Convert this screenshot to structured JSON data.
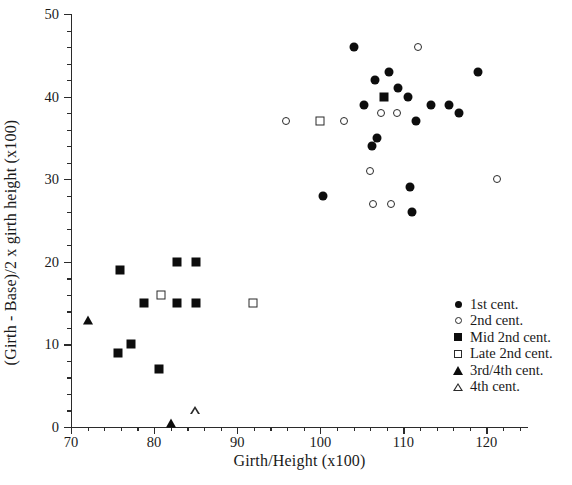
{
  "chart_data": {
    "type": "scatter",
    "title": "",
    "xlabel": "Girth/Height (x100)",
    "ylabel": "(Girth - Base)/2 x girth height (x100)",
    "xlim": [
      70,
      125
    ],
    "ylim": [
      0,
      50
    ],
    "xticks": [
      70,
      80,
      90,
      100,
      110,
      120
    ],
    "yticks": [
      0,
      10,
      20,
      30,
      40,
      50
    ],
    "xtick_labels": [
      "70",
      "80",
      "90",
      "100",
      "110",
      "120"
    ],
    "ytick_labels": [
      "0",
      "10",
      "20",
      "30",
      "40",
      "50"
    ],
    "minor_tick_step_x": 2,
    "minor_tick_step_y": 2,
    "grid": false,
    "legend_position": "lower-right-inside",
    "series": [
      {
        "name": "1st cent.",
        "marker": "filled-circle",
        "color": "#0d0d0d",
        "points": [
          [
            100.3,
            28
          ],
          [
            104.0,
            46
          ],
          [
            105.3,
            39
          ],
          [
            106.6,
            42
          ],
          [
            106.2,
            34
          ],
          [
            106.8,
            35
          ],
          [
            108.3,
            43
          ],
          [
            109.3,
            41
          ],
          [
            110.6,
            40
          ],
          [
            110.8,
            29
          ],
          [
            111.0,
            26
          ],
          [
            111.5,
            37
          ],
          [
            113.3,
            39
          ],
          [
            115.5,
            39
          ],
          [
            116.7,
            38
          ],
          [
            119.0,
            43
          ]
        ]
      },
      {
        "name": "2nd cent.",
        "marker": "open-circle",
        "color": "#2a2a2a",
        "points": [
          [
            95.9,
            37
          ],
          [
            102.8,
            37
          ],
          [
            106.0,
            31
          ],
          [
            106.4,
            27
          ],
          [
            107.3,
            38
          ],
          [
            108.5,
            27
          ],
          [
            109.2,
            38
          ],
          [
            111.8,
            46
          ],
          [
            121.3,
            30
          ]
        ]
      },
      {
        "name": "Mid 2nd cent.",
        "marker": "filled-square",
        "color": "#0d0d0d",
        "points": [
          [
            75.6,
            9
          ],
          [
            75.9,
            19
          ],
          [
            77.2,
            10
          ],
          [
            78.8,
            15
          ],
          [
            80.6,
            7
          ],
          [
            82.7,
            20
          ],
          [
            82.7,
            15
          ],
          [
            85.0,
            20
          ],
          [
            85.0,
            15
          ],
          [
            107.7,
            40
          ]
        ]
      },
      {
        "name": "Late 2nd cent.",
        "marker": "open-square",
        "color": "#2a2a2a",
        "points": [
          [
            80.8,
            16
          ],
          [
            91.9,
            15
          ],
          [
            100.0,
            37
          ]
        ]
      },
      {
        "name": "3rd/4th cent.",
        "marker": "filled-triangle",
        "color": "#0d0d0d",
        "points": [
          [
            72.0,
            13
          ],
          [
            82.0,
            0.5
          ]
        ]
      },
      {
        "name": "4th cent.",
        "marker": "open-triangle",
        "color": "#2a2a2a",
        "points": [
          [
            84.9,
            2
          ]
        ]
      }
    ]
  }
}
